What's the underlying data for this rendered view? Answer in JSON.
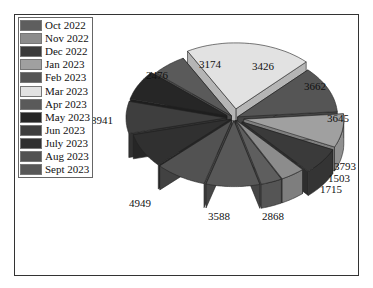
{
  "chart_data": {
    "type": "pie",
    "style": "3d-exploded",
    "title": "",
    "categories": [
      "Oct 2022",
      "Nov 2022",
      "Dec 2022",
      "Jan 2023",
      "Feb 2023",
      "Mar 2023",
      "Apr 2023",
      "May 2023",
      "Jun 2023",
      "July 2023",
      "Aug 2023",
      "Sept 2023"
    ],
    "values": [
      1503,
      1715,
      2868,
      3588,
      4949,
      8941,
      2476,
      3174,
      3426,
      3662,
      3645,
      3793
    ],
    "colors": [
      "#5e5e5e",
      "#8c8c8c",
      "#3a3a3a",
      "#a0a0a0",
      "#555555",
      "#e2e2e2",
      "#5a5a5a",
      "#262626",
      "#3e3e3e",
      "#303030",
      "#525252",
      "#585858"
    ],
    "legend_position": "top-left",
    "data_labels": true
  },
  "legend": {
    "items": [
      {
        "label": "Oct 2022",
        "color": "#5e5e5e"
      },
      {
        "label": "Nov 2022",
        "color": "#8c8c8c"
      },
      {
        "label": "Dec 2022",
        "color": "#3a3a3a"
      },
      {
        "label": "Jan 2023",
        "color": "#a0a0a0"
      },
      {
        "label": "Feb 2023",
        "color": "#555555"
      },
      {
        "label": "Mar 2023",
        "color": "#e2e2e2"
      },
      {
        "label": "Apr 2023",
        "color": "#5a5a5a"
      },
      {
        "label": "May 2023",
        "color": "#262626"
      },
      {
        "label": "Jun 2023",
        "color": "#3e3e3e"
      },
      {
        "label": "July 2023",
        "color": "#303030"
      },
      {
        "label": "Aug 2023",
        "color": "#525252"
      },
      {
        "label": "Sept 2023",
        "color": "#585858"
      }
    ]
  }
}
